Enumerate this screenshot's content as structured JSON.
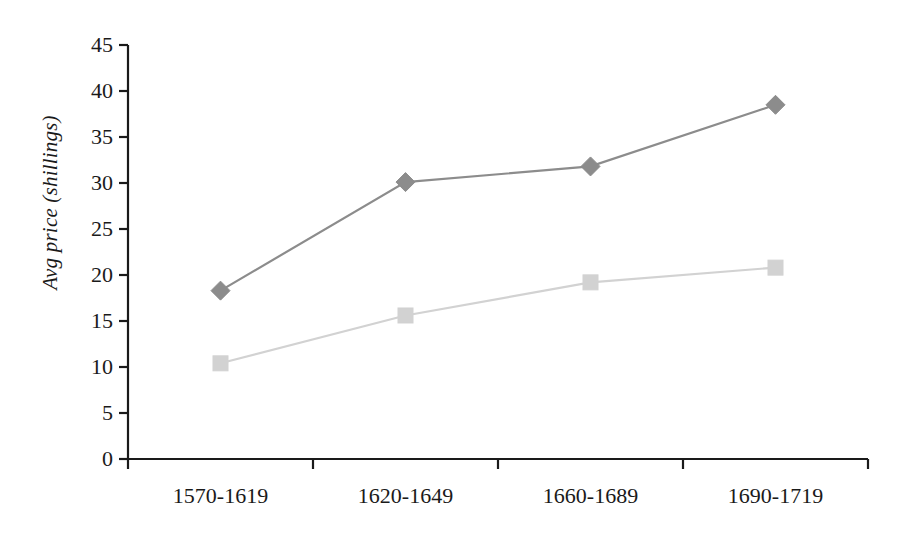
{
  "chart_data": {
    "type": "line",
    "title": "",
    "subtitle": "",
    "xlabel": "",
    "ylabel": "Avg price (shillings)",
    "categories": [
      "1570-1619",
      "1620-1649",
      "1660-1689",
      "1690-1719"
    ],
    "series": [
      {
        "name": "series-1-diamond",
        "marker": "diamond",
        "color": "#8c8c8c",
        "values": [
          18.3,
          30.1,
          31.8,
          38.5
        ]
      },
      {
        "name": "series-2-square",
        "marker": "square",
        "color": "#d2d2d2",
        "values": [
          10.4,
          15.6,
          19.2,
          20.8
        ]
      }
    ],
    "ylim": [
      0,
      45
    ],
    "y_ticks": [
      "0",
      "5",
      "10",
      "15",
      "20",
      "25",
      "30",
      "35",
      "40",
      "45"
    ],
    "grid": false,
    "legend": "none",
    "axis_color": "#1a1a1a"
  }
}
